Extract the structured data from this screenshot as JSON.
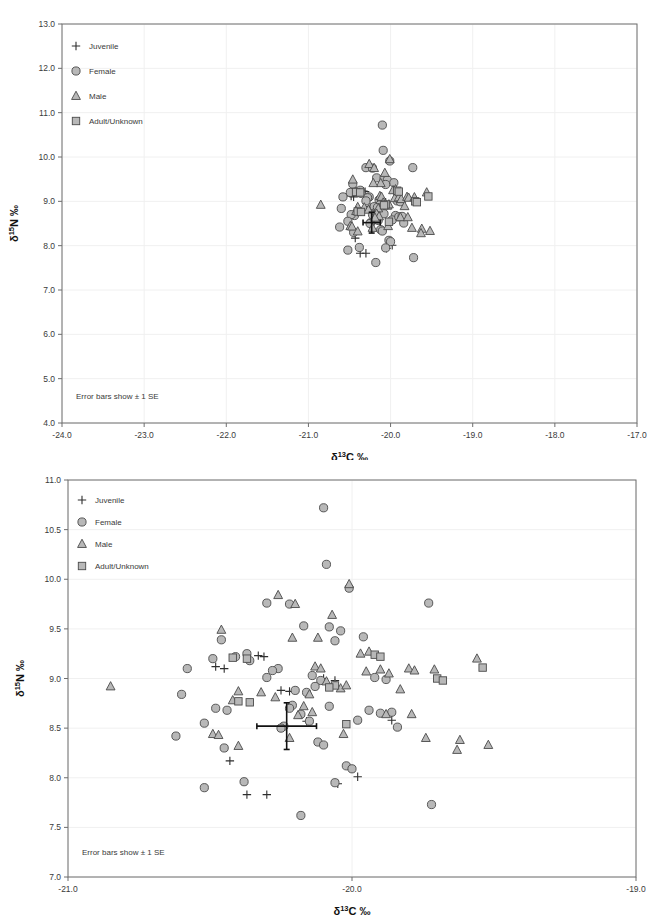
{
  "figure": {
    "axis_title_x_prefix": "δ",
    "axis_title_x_sup": "13",
    "axis_title_x_rest": "C ‰",
    "axis_title_y_prefix": "δ",
    "axis_title_y_sup": "15",
    "axis_title_y_rest": "N ‰",
    "note": "Error bars show ± 1 SE",
    "marker_fill": "#b8b8b8",
    "marker_stroke": "#4a4a4a",
    "frame_color": "#6e6e6e"
  },
  "legend": {
    "items": [
      {
        "label": "Juvenile",
        "symbol": "plus",
        "key": "juvenile"
      },
      {
        "label": "Female",
        "symbol": "circle",
        "key": "female"
      },
      {
        "label": "Male",
        "symbol": "triangle",
        "key": "male"
      },
      {
        "label": "Adult/Unknown",
        "symbol": "square",
        "key": "adult_unknown"
      }
    ]
  },
  "chart_data": [
    {
      "id": "top",
      "type": "scatter",
      "title": "",
      "xlabel": "δ13C ‰",
      "ylabel": "δ15N ‰",
      "xlim": [
        -24.0,
        -17.0
      ],
      "ylim": [
        4.0,
        13.0
      ],
      "xticks": [
        -24.0,
        -23.0,
        -22.0,
        -21.0,
        -20.0,
        -19.0,
        -18.0,
        -17.0
      ],
      "yticks": [
        4.0,
        5.0,
        6.0,
        7.0,
        8.0,
        9.0,
        10.0,
        11.0,
        12.0,
        13.0
      ],
      "xtick_labels": [
        "-24.0",
        "-23.0",
        "-22.0",
        "-21.0",
        "-20.0",
        "-19.0",
        "-18.0",
        "-17.0"
      ],
      "ytick_labels": [
        "4.0",
        "5.0",
        "6.0",
        "7.0",
        "8.0",
        "9.0",
        "10.0",
        "11.0",
        "12.0",
        "13.0"
      ],
      "grid": true,
      "legend_position": "top-left",
      "annotation": "Error bars show ± 1 SE",
      "error_bar": {
        "x": -20.23,
        "y": 8.52,
        "x_err": 0.105,
        "y_err": 0.235
      }
    },
    {
      "id": "bottom",
      "type": "scatter",
      "title": "",
      "xlabel": "δ13C ‰",
      "ylabel": "δ15N ‰",
      "xlim": [
        -21.0,
        -19.0
      ],
      "ylim": [
        7.0,
        11.0
      ],
      "xticks": [
        -21.0,
        -20.0,
        -19.0
      ],
      "yticks": [
        7.0,
        7.5,
        8.0,
        8.5,
        9.0,
        9.5,
        10.0,
        10.5,
        11.0
      ],
      "xtick_labels": [
        "-21.0",
        "-20.0",
        "-19.0"
      ],
      "ytick_labels": [
        "7.0",
        "7.5",
        "8.0",
        "8.5",
        "9.0",
        "9.5",
        "10.0",
        "10.5",
        "11.0"
      ],
      "grid": true,
      "legend_position": "top-left",
      "annotation": "Error bars show ± 1 SE",
      "error_bar": {
        "x": -20.23,
        "y": 8.52,
        "x_err": 0.105,
        "y_err": 0.235
      }
    }
  ],
  "points": {
    "female": [
      [
        -20.1,
        10.72
      ],
      [
        -20.09,
        10.15
      ],
      [
        -20.01,
        9.91
      ],
      [
        -19.73,
        9.76
      ],
      [
        -20.3,
        9.76
      ],
      [
        -20.22,
        9.75
      ],
      [
        -20.17,
        9.53
      ],
      [
        -20.08,
        9.52
      ],
      [
        -20.04,
        9.48
      ],
      [
        -19.96,
        9.42
      ],
      [
        -20.06,
        9.38
      ],
      [
        -20.46,
        9.39
      ],
      [
        -20.41,
        9.22
      ],
      [
        -20.37,
        9.25
      ],
      [
        -20.36,
        9.18
      ],
      [
        -20.49,
        9.2
      ],
      [
        -20.58,
        9.1
      ],
      [
        -20.26,
        9.1
      ],
      [
        -20.28,
        9.08
      ],
      [
        -20.3,
        9.01
      ],
      [
        -20.14,
        9.03
      ],
      [
        -20.11,
        8.98
      ],
      [
        -20.13,
        8.92
      ],
      [
        -19.92,
        9.01
      ],
      [
        -19.88,
        8.99
      ],
      [
        -20.6,
        8.84
      ],
      [
        -20.2,
        8.88
      ],
      [
        -20.16,
        8.86
      ],
      [
        -20.44,
        8.68
      ],
      [
        -20.48,
        8.7
      ],
      [
        -20.21,
        8.73
      ],
      [
        -20.22,
        8.7
      ],
      [
        -20.08,
        8.72
      ],
      [
        -19.94,
        8.68
      ],
      [
        -20.18,
        8.64
      ],
      [
        -20.52,
        8.55
      ],
      [
        -20.24,
        8.52
      ],
      [
        -20.25,
        8.5
      ],
      [
        -20.15,
        8.57
      ],
      [
        -19.98,
        8.58
      ],
      [
        -19.9,
        8.65
      ],
      [
        -19.84,
        8.51
      ],
      [
        -20.62,
        8.42
      ],
      [
        -20.45,
        8.3
      ],
      [
        -20.12,
        8.36
      ],
      [
        -20.1,
        8.33
      ],
      [
        -20.02,
        8.12
      ],
      [
        -20.0,
        8.09
      ],
      [
        -20.06,
        7.95
      ],
      [
        -20.38,
        7.96
      ],
      [
        -20.52,
        7.9
      ],
      [
        -20.18,
        7.62
      ],
      [
        -19.72,
        7.73
      ],
      [
        -19.86,
        8.66
      ]
    ],
    "male": [
      [
        -20.85,
        8.92
      ],
      [
        -20.26,
        9.84
      ],
      [
        -20.2,
        9.75
      ],
      [
        -20.01,
        9.95
      ],
      [
        -20.07,
        9.64
      ],
      [
        -20.12,
        9.41
      ],
      [
        -20.21,
        9.41
      ],
      [
        -20.46,
        9.49
      ],
      [
        -20.4,
        8.87
      ],
      [
        -20.32,
        8.86
      ],
      [
        -20.27,
        8.81
      ],
      [
        -20.42,
        8.78
      ],
      [
        -20.49,
        8.44
      ],
      [
        -20.47,
        8.43
      ],
      [
        -20.13,
        9.12
      ],
      [
        -20.11,
        9.1
      ],
      [
        -19.95,
        9.07
      ],
      [
        -19.9,
        9.09
      ],
      [
        -19.87,
        9.05
      ],
      [
        -19.8,
        9.1
      ],
      [
        -19.78,
        9.08
      ],
      [
        -19.83,
        8.89
      ],
      [
        -19.94,
        9.27
      ],
      [
        -19.97,
        9.25
      ],
      [
        -20.09,
        8.97
      ],
      [
        -20.06,
        8.94
      ],
      [
        -20.04,
        8.9
      ],
      [
        -20.02,
        8.93
      ],
      [
        -20.15,
        8.84
      ],
      [
        -20.17,
        8.72
      ],
      [
        -20.14,
        8.66
      ],
      [
        -20.19,
        8.63
      ],
      [
        -19.88,
        8.64
      ],
      [
        -19.79,
        8.64
      ],
      [
        -19.74,
        8.4
      ],
      [
        -20.22,
        8.4
      ],
      [
        -20.4,
        8.32
      ],
      [
        -20.03,
        8.44
      ],
      [
        -19.56,
        9.2
      ],
      [
        -19.62,
        8.38
      ],
      [
        -19.63,
        8.28
      ],
      [
        -19.52,
        8.33
      ],
      [
        -19.71,
        9.09
      ]
    ],
    "adult_unknown": [
      [
        -20.42,
        9.21
      ],
      [
        -20.37,
        9.2
      ],
      [
        -20.4,
        8.77
      ],
      [
        -20.36,
        8.76
      ],
      [
        -19.92,
        9.24
      ],
      [
        -19.9,
        9.22
      ],
      [
        -19.7,
        9.0
      ],
      [
        -19.68,
        8.98
      ],
      [
        -20.06,
        8.93
      ],
      [
        -20.08,
        8.91
      ],
      [
        -20.02,
        8.54
      ],
      [
        -19.54,
        9.11
      ]
    ],
    "juvenile": [
      [
        -20.48,
        9.12
      ],
      [
        -20.45,
        9.1
      ],
      [
        -20.33,
        9.23
      ],
      [
        -20.31,
        9.22
      ],
      [
        -20.25,
        8.88
      ],
      [
        -20.22,
        8.87
      ],
      [
        -20.1,
        9.0
      ],
      [
        -20.06,
        8.98
      ],
      [
        -20.16,
        8.57
      ],
      [
        -19.86,
        8.58
      ],
      [
        -20.43,
        8.17
      ],
      [
        -20.05,
        7.94
      ],
      [
        -20.37,
        7.83
      ],
      [
        -20.3,
        7.83
      ],
      [
        -19.98,
        8.01
      ]
    ]
  }
}
